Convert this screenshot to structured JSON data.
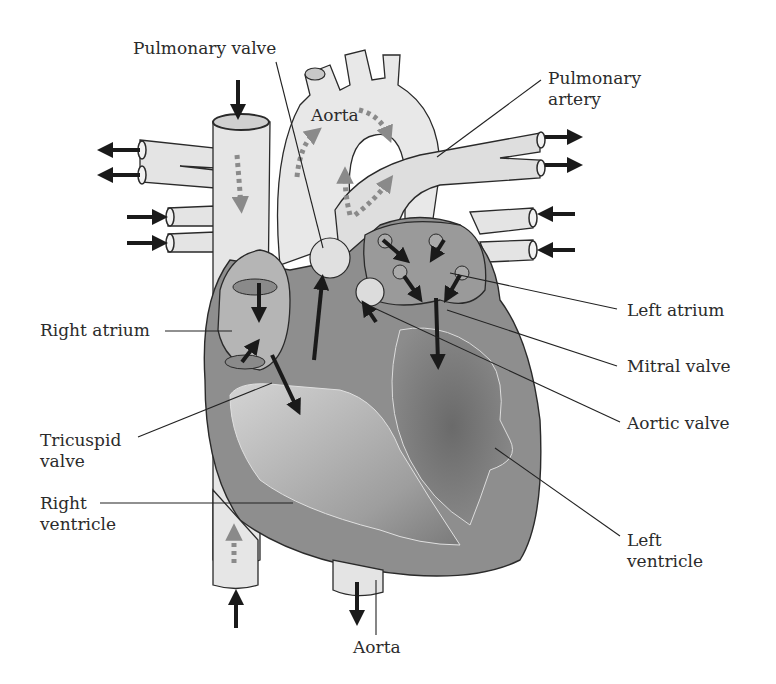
{
  "diagram": {
    "colors": {
      "vessel": "#e3e3e3",
      "vessel_outline": "#2a2a2a",
      "wall": "#8f8f8f",
      "chamber_light": "#bdbdbd",
      "chamber_dark": "#6f6f6f",
      "arrow": "#1a1a1a",
      "flow_dots": "#8a8a8a",
      "leader": "#222222",
      "text": "#2b2b2b"
    },
    "labels": {
      "pulmonary_valve": "Pulmonary valve",
      "aorta_top": "Aorta",
      "pulmonary_artery": "Pulmonary\nartery",
      "right_atrium": "Right atrium",
      "left_atrium": "Left atrium",
      "mitral_valve": "Mitral valve",
      "aortic_valve": "Aortic valve",
      "tricuspid_valve": "Tricuspid\nvalve",
      "right_ventricle": "Right\nventricle",
      "left_ventricle": "Left\nventricle",
      "aorta_bottom": "Aorta"
    }
  }
}
